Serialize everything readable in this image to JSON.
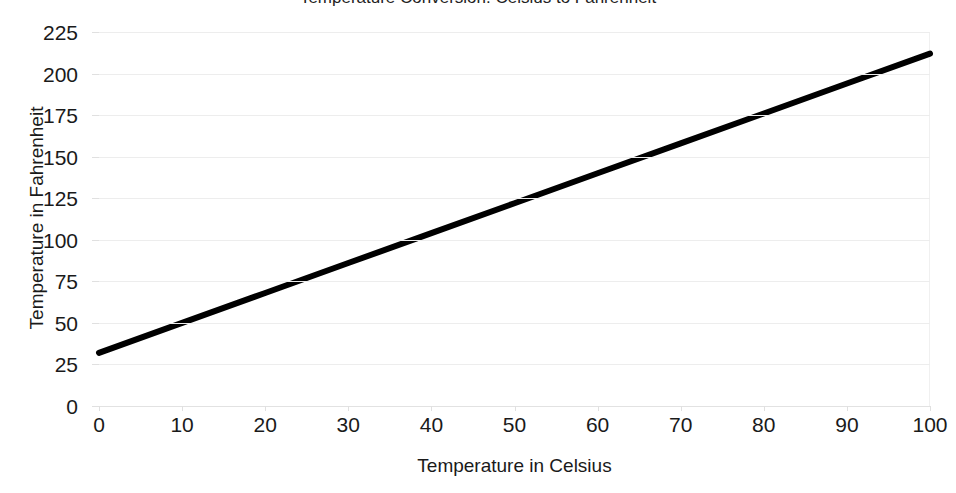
{
  "chart_data": {
    "type": "line",
    "title": "Temperature Conversion: Celsius to Fahrenheit",
    "title_clipped": true,
    "xlabel": "Temperature in Celsius",
    "ylabel": "Temperature in Fahrenheit",
    "xlim": [
      0,
      100
    ],
    "ylim": [
      0,
      225
    ],
    "xticks": [
      0,
      10,
      20,
      30,
      40,
      50,
      60,
      70,
      80,
      90,
      100
    ],
    "xtick_labels": [
      "0",
      "10",
      "20",
      "30",
      "40",
      "50",
      "60",
      "70",
      "80",
      "90",
      "100"
    ],
    "yticks": [
      0,
      25,
      50,
      75,
      100,
      125,
      150,
      175,
      200,
      225
    ],
    "ytick_labels": [
      "0",
      "25",
      "50",
      "75",
      "100",
      "125",
      "150",
      "175",
      "200",
      "225"
    ],
    "grid": true,
    "grid_axis": "y",
    "grid_color": "#ededed",
    "legend": false,
    "legend_position": "none",
    "series": [
      {
        "name": "Fahrenheit",
        "color": "#000000",
        "line_width": 6,
        "x": [
          0,
          10,
          20,
          30,
          40,
          50,
          60,
          70,
          80,
          90,
          100
        ],
        "values": [
          32,
          50,
          68,
          86,
          104,
          122,
          140,
          158,
          176,
          194,
          212
        ]
      }
    ]
  },
  "colors": {
    "background": "#ffffff",
    "series_line": "#000000",
    "gridline": "#ededed",
    "axis": "#e2e2e2",
    "text": "#1a1a1a"
  }
}
